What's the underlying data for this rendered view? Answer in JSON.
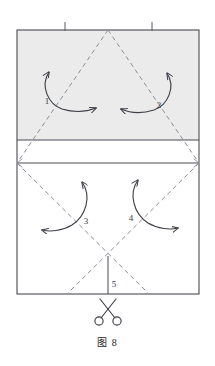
{
  "figure": {
    "caption": "图 8",
    "caption_label": "Figure 8"
  },
  "colors": {
    "paper_outline": "#4a4a52",
    "paper_fill": "#ffffff",
    "shaded_fill": "#ebebeb",
    "crease_dashed": "#8d8d99",
    "arrow_stroke": "#3f3f48",
    "scissors_stroke": "#3f3f48",
    "label_text": "#3a3a45",
    "tick_mark": "#5a5a62",
    "caption_text": "#1f1f24"
  },
  "sheet": {
    "name": "paper-sheet",
    "left": 17,
    "top": 30,
    "right": 199,
    "bottom": 294,
    "width": 182,
    "height": 264
  },
  "regions": [
    {
      "name": "shaded-upper-band",
      "label": "shaded upper panel",
      "top": 30,
      "bottom": 140,
      "fill": "#ebebeb"
    },
    {
      "name": "middle-strip",
      "label": "narrow white strip",
      "top": 140,
      "bottom": 163,
      "fill": "#ffffff"
    },
    {
      "name": "lower-panel",
      "label": "lower white panel",
      "top": 163,
      "bottom": 294,
      "fill": "#ffffff"
    }
  ],
  "horizontal_creases": [
    {
      "name": "crease-line-upper",
      "y": 140
    },
    {
      "name": "crease-line-lower",
      "y": 163
    }
  ],
  "tick_marks": [
    {
      "name": "tick-mark-left",
      "x": 65,
      "y_top": 22,
      "y_bottom": 31
    },
    {
      "name": "tick-mark-right",
      "x": 152,
      "y_top": 22,
      "y_bottom": 31
    }
  ],
  "dashed_creases": [
    {
      "name": "crease-upper-left-diagonal",
      "x1": 108,
      "y1": 30,
      "x2": 17,
      "y2": 163
    },
    {
      "name": "crease-upper-right-diagonal",
      "x1": 108,
      "y1": 30,
      "x2": 199,
      "y2": 163
    },
    {
      "name": "crease-lower-left-diagonal",
      "x1": 17,
      "y1": 163,
      "x2": 149,
      "y2": 294
    },
    {
      "name": "crease-lower-right-diagonal",
      "x1": 199,
      "y1": 163,
      "x2": 67,
      "y2": 294
    }
  ],
  "vertical_crease": {
    "name": "center-cut-line",
    "x": 108,
    "y1": 256,
    "y2": 294
  },
  "fold_labels": [
    {
      "name": "fold-label-1",
      "text": "1",
      "x": 47,
      "y": 104
    },
    {
      "name": "fold-label-2",
      "text": "2",
      "x": 159,
      "y": 108
    },
    {
      "name": "fold-label-3",
      "text": "3",
      "x": 86,
      "y": 224
    },
    {
      "name": "fold-label-4",
      "text": "4",
      "x": 131,
      "y": 221
    },
    {
      "name": "fold-label-5",
      "text": "5",
      "x": 114,
      "y": 287
    }
  ],
  "arrows": [
    {
      "name": "fold-arrow-1",
      "label": "1",
      "description": "double-headed curved fold arrow, upper left panel",
      "path": "M 49 72 C 40 86 48 104 62 109 C 75 113 86 112 96 108",
      "head_start": {
        "x": 49,
        "y": 72,
        "angle": -62
      },
      "head_end": {
        "x": 96,
        "y": 108,
        "angle": 338
      }
    },
    {
      "name": "fold-arrow-2",
      "label": "2",
      "description": "double-headed curved fold arrow, upper right panel",
      "path": "M 167 73 C 176 87 168 105 154 110 C 141 114 130 113 121 109",
      "head_start": {
        "x": 167,
        "y": 73,
        "angle": -118
      },
      "head_end": {
        "x": 121,
        "y": 109,
        "angle": 202
      }
    },
    {
      "name": "fold-arrow-3",
      "label": "3",
      "description": "double-headed curved fold arrow, lower left panel",
      "path": "M 82 182 C 92 196 86 216 72 225 C 62 231 50 232 42 230",
      "head_start": {
        "x": 82,
        "y": 182,
        "angle": -125
      },
      "head_end": {
        "x": 42,
        "y": 230,
        "angle": 192
      }
    },
    {
      "name": "fold-arrow-4",
      "label": "4",
      "description": "double-headed curved fold arrow, lower right panel",
      "path": "M 138 180 C 128 194 134 214 148 223 C 158 229 170 230 178 228",
      "head_start": {
        "x": 138,
        "y": 180,
        "angle": -55
      },
      "head_end": {
        "x": 178,
        "y": 228,
        "angle": -12
      }
    }
  ],
  "scissors": {
    "name": "scissors-icon",
    "label": "cut here",
    "center_x": 108,
    "top_y": 298,
    "bottom_y": 326
  }
}
